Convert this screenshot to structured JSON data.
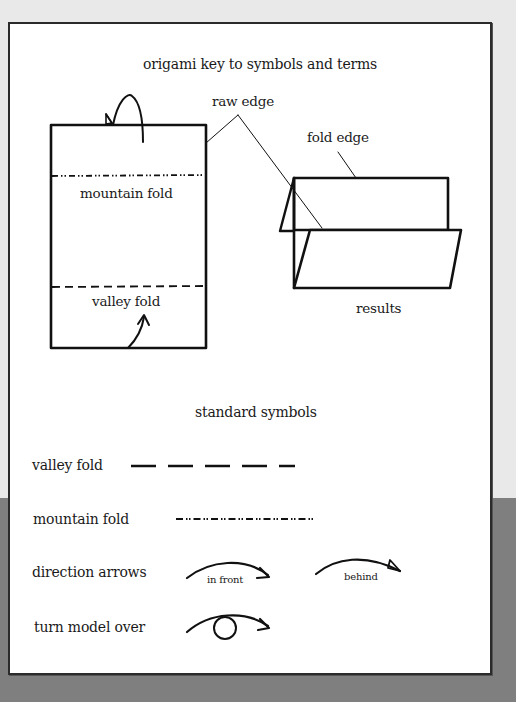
{
  "page": {
    "title": "origami key to symbols and terms",
    "colors": {
      "background_top": "#e9e9e9",
      "background_bottom": "#7f7f7f",
      "panel": "#ffffff",
      "ink": "#1a1a1a"
    }
  },
  "diagram": {
    "callouts": {
      "raw_edge": "raw edge",
      "fold_edge": "fold edge",
      "mountain_fold": "mountain fold",
      "valley_fold": "valley fold",
      "results": "results"
    }
  },
  "standard_symbols": {
    "heading": "standard symbols",
    "rows": [
      {
        "label": "valley fold",
        "symbol": "dashed-line"
      },
      {
        "label": "mountain fold",
        "symbol": "dash-dot-dot-line"
      },
      {
        "label": "direction arrows",
        "symbol": "arrows",
        "variants": [
          {
            "caption": "in front"
          },
          {
            "caption": "behind"
          }
        ]
      },
      {
        "label": "turn model over",
        "symbol": "turn-over-arrow"
      }
    ]
  }
}
